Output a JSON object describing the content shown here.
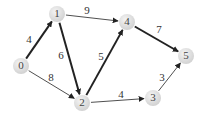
{
  "graph": {
    "nodes": [
      {
        "id": "0",
        "label": "0",
        "x": 21,
        "y": 66
      },
      {
        "id": "1",
        "label": "1",
        "x": 57,
        "y": 14
      },
      {
        "id": "2",
        "label": "2",
        "x": 82,
        "y": 103
      },
      {
        "id": "3",
        "label": "3",
        "x": 153,
        "y": 98
      },
      {
        "id": "4",
        "label": "4",
        "x": 127,
        "y": 22
      },
      {
        "id": "5",
        "label": "5",
        "x": 186,
        "y": 56
      }
    ],
    "edges": [
      {
        "from": "0",
        "to": "1",
        "weight": "4",
        "bold": true,
        "lx": 29,
        "ly": 40
      },
      {
        "from": "0",
        "to": "2",
        "weight": "8",
        "bold": false,
        "lx": 51,
        "ly": 78
      },
      {
        "from": "1",
        "to": "4",
        "weight": "9",
        "bold": false,
        "lx": 87,
        "ly": 11
      },
      {
        "from": "1",
        "to": "2",
        "weight": "6",
        "bold": true,
        "lx": 61,
        "ly": 56
      },
      {
        "from": "2",
        "to": "4",
        "weight": "5",
        "bold": true,
        "lx": 101,
        "ly": 57
      },
      {
        "from": "2",
        "to": "3",
        "weight": "4",
        "bold": false,
        "lx": 121,
        "ly": 95
      },
      {
        "from": "4",
        "to": "5",
        "weight": "7",
        "bold": true,
        "lx": 159,
        "ly": 30
      },
      {
        "from": "3",
        "to": "5",
        "weight": "3",
        "bold": false,
        "lx": 162,
        "ly": 78
      }
    ]
  },
  "style": {
    "node_fill": "#e0e0e0",
    "node_radius": 8,
    "edge_color": "#222222",
    "label_color": "#333333"
  }
}
